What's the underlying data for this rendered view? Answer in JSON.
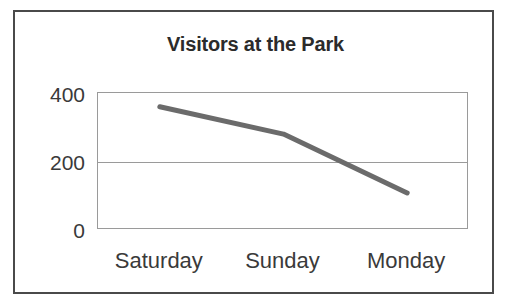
{
  "figure": {
    "background_color": "#ffffff",
    "border_color": "#4a4a4a"
  },
  "chart_data": {
    "type": "line",
    "title": "Visitors at the Park",
    "xlabel": "",
    "ylabel": "",
    "categories": [
      "Saturday",
      "Sunday",
      "Monday"
    ],
    "values": [
      360,
      280,
      108
    ],
    "series": [
      {
        "name": "Visitors",
        "values": [
          360,
          280,
          108
        ],
        "color": "#6b6b6b"
      }
    ],
    "ylim": [
      0,
      400
    ],
    "yticks": [
      "400",
      "200",
      "0"
    ],
    "ytick_values": [
      400,
      200,
      0
    ],
    "grid": true,
    "gridline_values": [
      200
    ],
    "legend": false,
    "legend_position": "none",
    "line_color": "#6b6b6b",
    "line_width": 5,
    "markers": false
  }
}
